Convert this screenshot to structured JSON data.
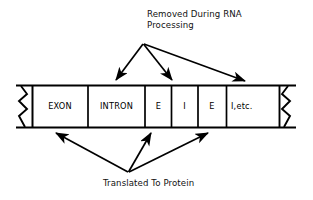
{
  "diagram": {
    "title_hidden": "",
    "top_caption": "Removed During RNA\nProcessing",
    "bottom_caption": "Translated To Protein",
    "stroke_color": "#000000",
    "background_color": "#ffffff",
    "bar": {
      "left_break_icon": "zigzag-break-icon",
      "right_break_icon": "zigzag-break-icon",
      "segments": [
        {
          "label": "EXON",
          "type": "exon"
        },
        {
          "label": "INTRON",
          "type": "intron"
        },
        {
          "label": "E",
          "type": "exon"
        },
        {
          "label": "I",
          "type": "intron"
        },
        {
          "label": "E",
          "type": "exon"
        },
        {
          "label": "I,etc.",
          "type": "intron"
        }
      ]
    },
    "arrows": {
      "top_group_name": "intron-pointer-arrows",
      "top_count": 3,
      "bottom_group_name": "exon-pointer-arrows",
      "bottom_count": 3
    }
  }
}
